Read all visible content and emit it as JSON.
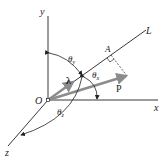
{
  "diagram": {
    "type": "3d-vector-direction-cosines",
    "axes": {
      "x_label": "x",
      "y_label": "y",
      "z_label": "z"
    },
    "origin_label": "O",
    "line_label": "L",
    "point_A_label": "A",
    "vector_P_label": "P",
    "unit_vector_label": "λ",
    "angles": {
      "theta_x": "θ",
      "theta_x_sub": "x",
      "theta_y": "θ",
      "theta_y_sub": "y",
      "theta_z": "θ",
      "theta_z_sub": "z"
    },
    "colors": {
      "line": "#222222",
      "vector": "#8c8c8c",
      "background": "#ffffff"
    }
  }
}
